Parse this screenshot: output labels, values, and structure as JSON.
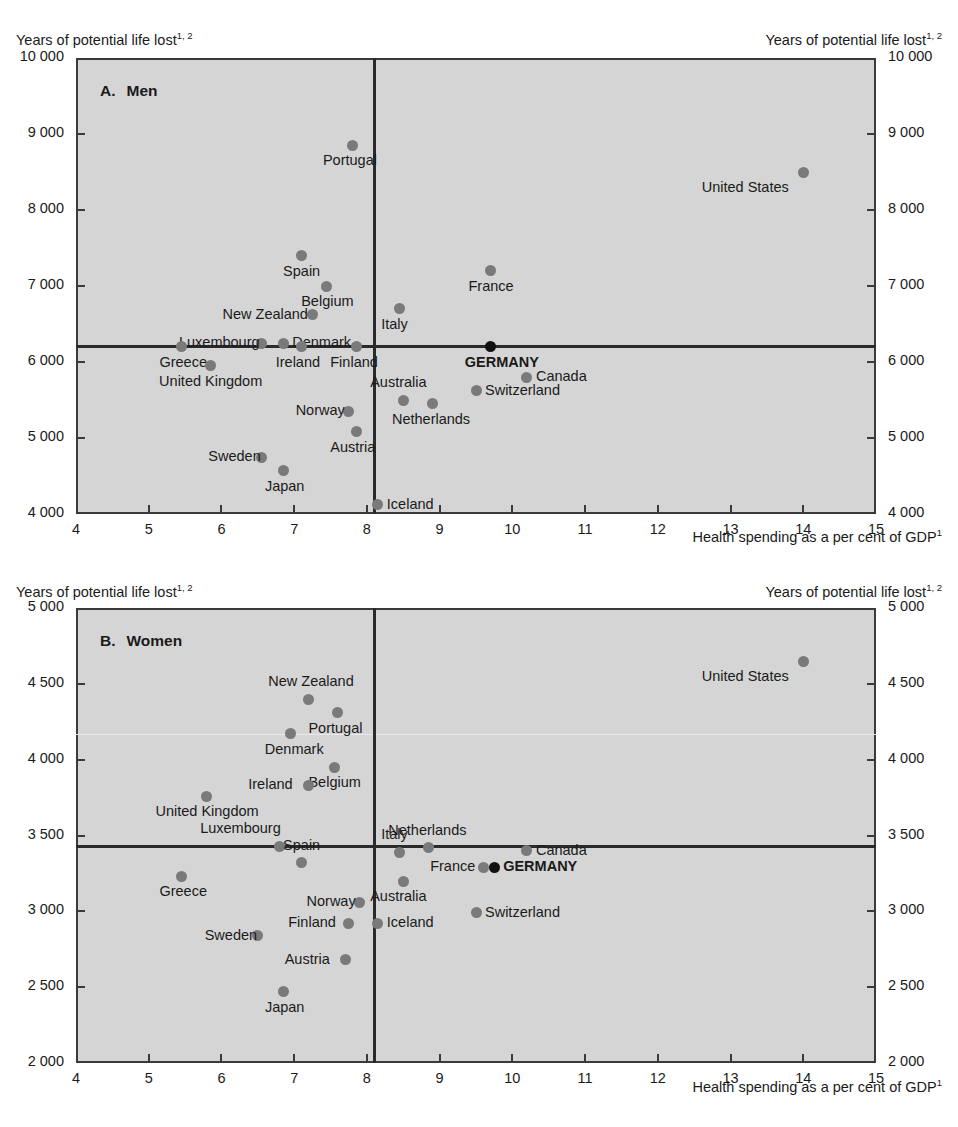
{
  "figure": {
    "y_axis_title": "Years of potential life lost",
    "y_axis_title_sup": "1, 2",
    "x_axis_title": "Health spending as a per cent of GDP",
    "x_axis_title_sup": "1"
  },
  "panels": {
    "men": {
      "letter": "A.",
      "name": "Men"
    },
    "women": {
      "letter": "B.",
      "name": "Women"
    }
  },
  "chart_data": [
    {
      "type": "scatter",
      "title": "A.  Men",
      "xlabel": "Health spending as a per cent of GDP1",
      "ylabel": "Years of potential life lost1, 2",
      "xlim": [
        4,
        15
      ],
      "ylim": [
        4000,
        10000
      ],
      "xticks": [
        4,
        5,
        6,
        7,
        8,
        9,
        10,
        11,
        12,
        13,
        14,
        15
      ],
      "xticklabels": [
        "4",
        "5",
        "6",
        "7",
        "8",
        "9",
        "10",
        "11",
        "12",
        "13",
        "14",
        "15"
      ],
      "yticks": [
        4000,
        5000,
        6000,
        7000,
        8000,
        9000,
        10000
      ],
      "yticklabels": [
        "4 000",
        "5 000",
        "6 000",
        "7 000",
        "8 000",
        "9 000",
        "10 000"
      ],
      "grid": false,
      "legend": "none",
      "reference_lines": {
        "vertical_x": 8.1,
        "horizontal_y": 6200
      },
      "points": [
        {
          "label": "Portugal",
          "x": 7.8,
          "y": 8850,
          "label_pos": "below",
          "highlight": false
        },
        {
          "label": "United States",
          "x": 14.0,
          "y": 8500,
          "label_pos": "below-left",
          "highlight": false
        },
        {
          "label": "Spain",
          "x": 7.1,
          "y": 7400,
          "label_pos": "below",
          "highlight": false
        },
        {
          "label": "France",
          "x": 9.7,
          "y": 7200,
          "label_pos": "below",
          "highlight": false
        },
        {
          "label": "Belgium",
          "x": 7.45,
          "y": 7000,
          "label_pos": "below",
          "highlight": false
        },
        {
          "label": "Italy",
          "x": 8.45,
          "y": 6700,
          "label_pos": "below",
          "highlight": false
        },
        {
          "label": "New Zealand",
          "x": 7.25,
          "y": 6620,
          "label_pos": "left",
          "highlight": false
        },
        {
          "label": "Luxembourg",
          "x": 6.55,
          "y": 6250,
          "label_pos": "left",
          "highlight": false
        },
        {
          "label": "Denmark",
          "x": 6.85,
          "y": 6250,
          "label_pos": "right",
          "highlight": false
        },
        {
          "label": "Greece",
          "x": 5.45,
          "y": 6200,
          "label_pos": "below",
          "highlight": false
        },
        {
          "label": "Ireland",
          "x": 7.1,
          "y": 6200,
          "label_pos": "below",
          "highlight": false
        },
        {
          "label": "Finland",
          "x": 7.85,
          "y": 6200,
          "label_pos": "below",
          "highlight": false
        },
        {
          "label": "GERMANY",
          "x": 9.7,
          "y": 6200,
          "label_pos": "below",
          "highlight": true
        },
        {
          "label": "United Kingdom",
          "x": 5.85,
          "y": 5950,
          "label_pos": "below",
          "highlight": false
        },
        {
          "label": "Canada",
          "x": 10.2,
          "y": 5800,
          "label_pos": "right",
          "highlight": false
        },
        {
          "label": "Switzerland",
          "x": 9.5,
          "y": 5620,
          "label_pos": "right",
          "highlight": false
        },
        {
          "label": "Australia",
          "x": 8.5,
          "y": 5500,
          "label_pos": "above",
          "highlight": false
        },
        {
          "label": "Netherlands",
          "x": 8.9,
          "y": 5450,
          "label_pos": "below",
          "highlight": false
        },
        {
          "label": "Norway",
          "x": 7.75,
          "y": 5350,
          "label_pos": "left",
          "highlight": false
        },
        {
          "label": "Austria",
          "x": 7.85,
          "y": 5080,
          "label_pos": "below",
          "highlight": false
        },
        {
          "label": "Sweden",
          "x": 6.55,
          "y": 4750,
          "label_pos": "left",
          "highlight": false
        },
        {
          "label": "Japan",
          "x": 6.85,
          "y": 4570,
          "label_pos": "below",
          "highlight": false
        },
        {
          "label": "Iceland",
          "x": 8.15,
          "y": 4120,
          "label_pos": "right",
          "highlight": false
        }
      ]
    },
    {
      "type": "scatter",
      "title": "B.  Women",
      "xlabel": "Health spending as a per cent of GDP1",
      "ylabel": "Years of potential life lost1, 2",
      "xlim": [
        4,
        15
      ],
      "ylim": [
        2000,
        5000
      ],
      "xticks": [
        4,
        5,
        6,
        7,
        8,
        9,
        10,
        11,
        12,
        13,
        14,
        15
      ],
      "xticklabels": [
        "4",
        "5",
        "6",
        "7",
        "8",
        "9",
        "10",
        "11",
        "12",
        "13",
        "14",
        "15"
      ],
      "yticks": [
        2000,
        2500,
        3000,
        3500,
        4000,
        4500,
        5000
      ],
      "yticklabels": [
        "2 000",
        "2 500",
        "3 000",
        "3 500",
        "4 000",
        "4 500",
        "5 000"
      ],
      "grid": false,
      "legend": "none",
      "reference_lines": {
        "vertical_x": 8.1,
        "horizontal_y": 3430
      },
      "points": [
        {
          "label": "United States",
          "x": 14.0,
          "y": 4650,
          "label_pos": "below-left",
          "highlight": false
        },
        {
          "label": "New Zealand",
          "x": 7.2,
          "y": 4400,
          "label_pos": "above",
          "highlight": false
        },
        {
          "label": "Portugal",
          "x": 7.6,
          "y": 4310,
          "label_pos": "below",
          "highlight": false
        },
        {
          "label": "Denmark",
          "x": 6.95,
          "y": 4170,
          "label_pos": "below",
          "highlight": false
        },
        {
          "label": "Belgium",
          "x": 7.55,
          "y": 3950,
          "label_pos": "below",
          "highlight": false
        },
        {
          "label": "Ireland",
          "x": 7.2,
          "y": 3830,
          "label_pos": "left",
          "highlight": false
        },
        {
          "label": "United Kingdom",
          "x": 5.8,
          "y": 3760,
          "label_pos": "below",
          "highlight": false
        },
        {
          "label": "Luxembourg",
          "x": 6.8,
          "y": 3430,
          "label_pos": "above-left",
          "highlight": false
        },
        {
          "label": "Italy",
          "x": 8.45,
          "y": 3390,
          "label_pos": "above",
          "highlight": false
        },
        {
          "label": "Netherlands",
          "x": 8.85,
          "y": 3420,
          "label_pos": "above",
          "highlight": false
        },
        {
          "label": "Canada",
          "x": 10.2,
          "y": 3400,
          "label_pos": "right",
          "highlight": false
        },
        {
          "label": "France",
          "x": 9.6,
          "y": 3290,
          "label_pos": "left",
          "highlight": false
        },
        {
          "label": "GERMANY",
          "x": 9.75,
          "y": 3290,
          "label_pos": "right",
          "highlight": true
        },
        {
          "label": "Spain",
          "x": 7.1,
          "y": 3320,
          "label_pos": "above",
          "highlight": false
        },
        {
          "label": "Greece",
          "x": 5.45,
          "y": 3230,
          "label_pos": "below",
          "highlight": false
        },
        {
          "label": "Australia",
          "x": 8.5,
          "y": 3200,
          "label_pos": "below",
          "highlight": false
        },
        {
          "label": "Norway",
          "x": 7.9,
          "y": 3060,
          "label_pos": "left",
          "highlight": false
        },
        {
          "label": "Iceland",
          "x": 8.15,
          "y": 2920,
          "label_pos": "right",
          "highlight": false
        },
        {
          "label": "Finland",
          "x": 7.75,
          "y": 2920,
          "label_pos": "left",
          "highlight": false
        },
        {
          "label": "Sweden",
          "x": 6.5,
          "y": 2840,
          "label_pos": "left",
          "highlight": false
        },
        {
          "label": "Switzerland",
          "x": 9.5,
          "y": 2990,
          "label_pos": "right",
          "highlight": false
        },
        {
          "label": "Austria",
          "x": 7.7,
          "y": 2680,
          "label_pos": "left",
          "highlight": false
        },
        {
          "label": "Japan",
          "x": 6.85,
          "y": 2470,
          "label_pos": "below",
          "highlight": false
        }
      ]
    }
  ]
}
